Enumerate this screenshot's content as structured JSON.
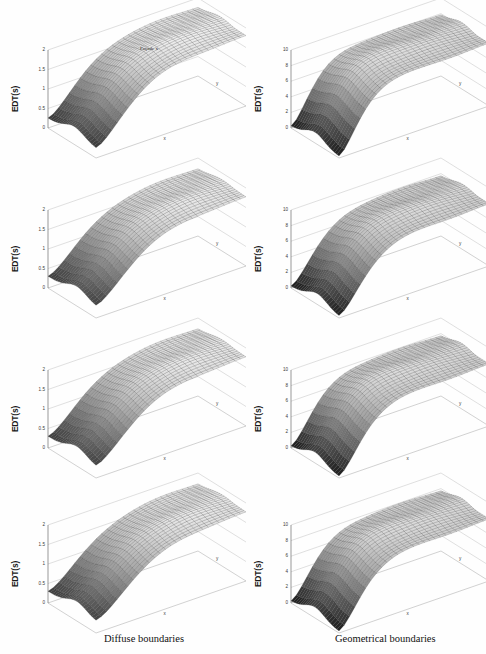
{
  "figure": {
    "columns": [
      {
        "id": "left",
        "caption": "Diffuse boundaries"
      },
      {
        "id": "right",
        "caption": "Geometrical boundaries"
      }
    ],
    "captions": {
      "left": "Diffuse boundaries",
      "right": "Geometrical boundaries"
    },
    "cut_text": "",
    "axis": {
      "ylabel": "EDT(s)",
      "xlabel": "x",
      "zlabel": "y",
      "toplabel": "Façade x"
    }
  },
  "chart_data": [
    {
      "type": "surface",
      "id": "row1-left",
      "title": "",
      "ylabel": "EDT(s)",
      "xlabel": "x",
      "zlabel": "y",
      "annotations": [
        "Façade x"
      ],
      "ylim": [
        0,
        2
      ],
      "yticks": [
        0,
        0.5,
        1,
        1.5,
        2
      ],
      "ytick_labels": [
        "0",
        "0.5",
        "1",
        "1.5",
        "2"
      ],
      "grid": true,
      "legend": "none",
      "nx": 28,
      "nz": 22,
      "surface": {
        "description": "EDT rises steeply from a dark low-valued trough at the near-left corner up to a high plateau across the far field; shallow ridge along the front-right.",
        "peak": 2.0,
        "trough": 0.25,
        "plateau": 1.75,
        "falloff_x": 0.28,
        "ridge_z": 0.55
      }
    },
    {
      "type": "surface",
      "id": "row1-right",
      "title": "",
      "ylabel": "EDT(s)",
      "xlabel": "x",
      "zlabel": "y",
      "annotations": [],
      "ylim": [
        0,
        10
      ],
      "yticks": [
        0,
        2,
        4,
        6,
        8,
        10
      ],
      "ytick_labels": [
        "0",
        "2",
        "4",
        "6",
        "8",
        "10"
      ],
      "grid": true,
      "legend": "none",
      "nx": 28,
      "nz": 22,
      "surface": {
        "description": "Very dark near-vertical wall at the near-left corner dropping to zero, then a flat high plateau over most of the domain.",
        "peak": 9.5,
        "trough": 0.2,
        "plateau": 7.5,
        "falloff_x": 0.18,
        "ridge_z": 0.5
      }
    },
    {
      "type": "surface",
      "id": "row2-left",
      "title": "",
      "ylabel": "EDT(s)",
      "xlabel": "x",
      "zlabel": "y",
      "annotations": [],
      "ylim": [
        0,
        2
      ],
      "yticks": [
        0,
        0.5,
        1,
        1.5,
        2
      ],
      "ytick_labels": [
        "0",
        "0.5",
        "1",
        "1.5",
        "2"
      ],
      "grid": true,
      "legend": "none",
      "nx": 28,
      "nz": 22,
      "surface": {
        "description": "Smooth rise from a dark valley at the near-left to a broad plateau; a pronounced curved ridge sweeps toward the front-right.",
        "peak": 2.0,
        "trough": 0.3,
        "plateau": 1.7,
        "falloff_x": 0.3,
        "ridge_z": 0.6
      }
    },
    {
      "type": "surface",
      "id": "row2-right",
      "title": "",
      "ylabel": "EDT(s)",
      "xlabel": "x",
      "zlabel": "y",
      "annotations": [],
      "ylim": [
        0,
        10
      ],
      "yticks": [
        0,
        2,
        4,
        6,
        8,
        10
      ],
      "ytick_labels": [
        "0",
        "2",
        "4",
        "6",
        "8",
        "10"
      ],
      "grid": true,
      "legend": "none",
      "nx": 28,
      "nz": 22,
      "surface": {
        "description": "Sharp dark peak at the near-left corner with a deep notch, flattening to a level plateau across the remainder.",
        "peak": 9.0,
        "trough": 0.2,
        "plateau": 7.0,
        "falloff_x": 0.22,
        "ridge_z": 0.55
      }
    },
    {
      "type": "surface",
      "id": "row3-left",
      "title": "",
      "ylabel": "EDT(s)",
      "xlabel": "x",
      "zlabel": "y",
      "annotations": [],
      "ylim": [
        0,
        2
      ],
      "yticks": [
        0,
        0.5,
        1,
        1.5,
        2
      ],
      "ytick_labels": [
        "0",
        "0.5",
        "1",
        "1.5",
        "2"
      ],
      "grid": true,
      "legend": "none",
      "nx": 28,
      "nz": 22,
      "surface": {
        "description": "Dark trough near the left edge rising to a wide plateau; gentle undulating ridge across the mid-field.",
        "peak": 2.0,
        "trough": 0.3,
        "plateau": 1.7,
        "falloff_x": 0.3,
        "ridge_z": 0.6
      }
    },
    {
      "type": "surface",
      "id": "row3-right",
      "title": "",
      "ylabel": "EDT(s)",
      "xlabel": "x",
      "zlabel": "y",
      "annotations": [],
      "ylim": [
        0,
        10
      ],
      "yticks": [
        0,
        2,
        4,
        6,
        8,
        10
      ],
      "ytick_labels": [
        "0",
        "2",
        "4",
        "6",
        "8",
        "10"
      ],
      "grid": true,
      "legend": "none",
      "nx": 28,
      "nz": 22,
      "surface": {
        "description": "Dark steep slope at the near-left dropping to zero, then an even plateau over the rest of the surface.",
        "peak": 9.0,
        "trough": 0.2,
        "plateau": 7.0,
        "falloff_x": 0.2,
        "ridge_z": 0.5
      }
    },
    {
      "type": "surface",
      "id": "row4-left",
      "title": "",
      "ylabel": "EDT(s)",
      "xlabel": "x",
      "zlabel": "y",
      "annotations": [],
      "ylim": [
        0,
        2
      ],
      "yticks": [
        0,
        0.5,
        1,
        1.5,
        2
      ],
      "ytick_labels": [
        "0",
        "0.5",
        "1",
        "1.5",
        "2"
      ],
      "grid": true,
      "legend": "none",
      "nx": 28,
      "nz": 22,
      "surface": {
        "description": "Dark low corner at the near-left rising smoothly into a broad flat plateau with a soft front ridge.",
        "peak": 2.0,
        "trough": 0.3,
        "plateau": 1.7,
        "falloff_x": 0.32,
        "ridge_z": 0.6
      }
    },
    {
      "type": "surface",
      "id": "row4-right",
      "title": "",
      "ylabel": "EDT(s)",
      "xlabel": "x",
      "zlabel": "y",
      "annotations": [],
      "ylim": [
        0,
        10
      ],
      "yticks": [
        0,
        2,
        4,
        6,
        8,
        10
      ],
      "ytick_labels": [
        "0",
        "2",
        "4",
        "6",
        "8",
        "10"
      ],
      "grid": true,
      "legend": "none",
      "nx": 28,
      "nz": 22,
      "surface": {
        "description": "Black wedge at the near-left corner falling to the floor, with a uniform plateau elsewhere.",
        "peak": 9.0,
        "trough": 0.2,
        "plateau": 7.0,
        "falloff_x": 0.2,
        "ridge_z": 0.5
      }
    }
  ]
}
